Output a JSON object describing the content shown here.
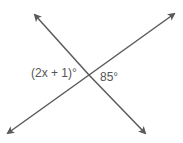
{
  "diagram": {
    "type": "intersecting lines",
    "labels": {
      "left_angle": "(2x + 1)°",
      "right_angle": "85°"
    },
    "line_color": "#5a5a5a"
  }
}
